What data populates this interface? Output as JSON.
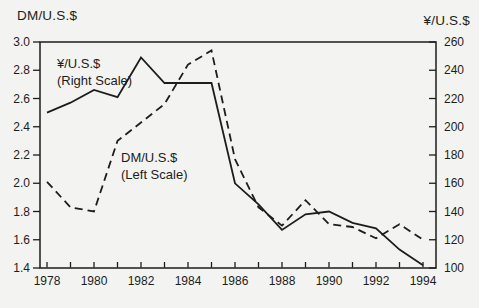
{
  "colors": {
    "background": "#f3f3f1",
    "ink": "#1d1d1b"
  },
  "chart_data": {
    "type": "line",
    "title": "",
    "left_axis_title": "DM/U.S.$",
    "right_axis_title": "¥/U.S.$",
    "x_label": "",
    "x": [
      1978,
      1979,
      1980,
      1981,
      1982,
      1983,
      1984,
      1985,
      1986,
      1987,
      1988,
      1989,
      1990,
      1991,
      1992,
      1993,
      1994
    ],
    "x_tick_labels": [
      "1978",
      "1980",
      "1982",
      "1984",
      "1986",
      "1988",
      "1990",
      "1992",
      "1994"
    ],
    "left_axis": {
      "title": "DM/U.S.$",
      "min": 1.4,
      "max": 3.0,
      "ticks": [
        "3.0",
        "2.8",
        "2.6",
        "2.4",
        "2.2",
        "2.0",
        "1.8",
        "1.6",
        "1.4"
      ]
    },
    "right_axis": {
      "title": "¥/U.S.$",
      "min": 100,
      "max": 260,
      "ticks": [
        "260",
        "240",
        "220",
        "200",
        "180",
        "160",
        "140",
        "120",
        "100"
      ]
    },
    "grid": "off",
    "legend_position": "annotations-inside-plot",
    "series": [
      {
        "name": "DM/U.S.$",
        "axis": "left",
        "style": "dashed",
        "values": [
          2.01,
          1.83,
          1.8,
          2.3,
          2.43,
          2.56,
          2.84,
          2.94,
          2.17,
          1.83,
          1.7,
          1.88,
          1.71,
          1.69,
          1.61,
          1.71,
          1.6
        ]
      },
      {
        "name": "¥/U.S.$",
        "axis": "right",
        "style": "solid",
        "values": [
          210,
          217,
          226,
          221,
          249,
          231,
          231,
          231,
          160,
          145,
          127,
          138,
          140,
          132,
          128,
          113,
          102
        ]
      }
    ],
    "annotations": [
      {
        "target": "yen-series",
        "lines": [
          "¥/U.S.$",
          "(Right Scale)"
        ]
      },
      {
        "target": "dm-series",
        "lines": [
          "DM/U.S.$",
          "(Left Scale)"
        ]
      }
    ]
  }
}
